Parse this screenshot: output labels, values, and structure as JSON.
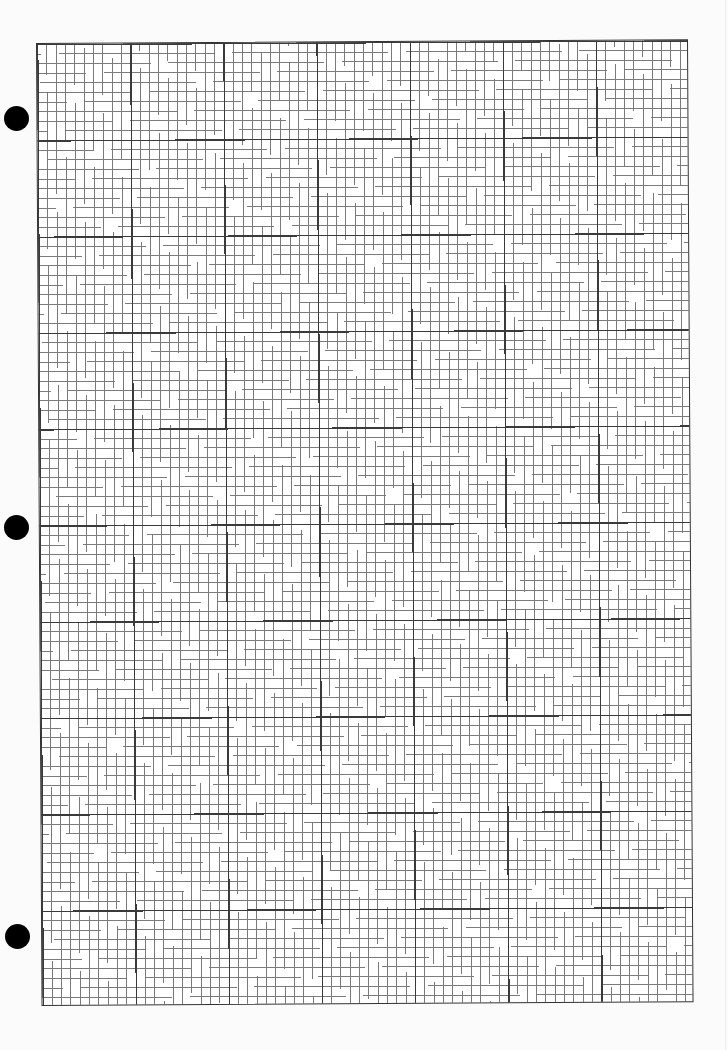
{
  "document": {
    "type": "graph-paper",
    "grid": {
      "major_columns": 7,
      "major_rows": 10,
      "minor_per_major": 10,
      "total_minor_columns": 70,
      "total_minor_rows": 100
    },
    "punch_holes": 3,
    "colors": {
      "paper": "#fbfbfb",
      "major_line": "#3a3a3a",
      "minor_line": "#7a7a7a",
      "hole": "#000000"
    }
  }
}
